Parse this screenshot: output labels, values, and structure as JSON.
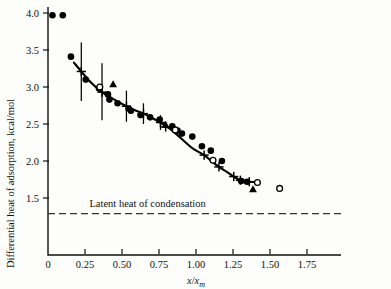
{
  "figure": {
    "caption_absent": true,
    "background_color": "#fdfdfc",
    "ink_color": "#111111"
  },
  "chart_data": {
    "type": "scatter",
    "title": "",
    "xlabel": "x/x_m",
    "xlabel_parts": {
      "numerator": "x",
      "slash": "/",
      "denominator": "x",
      "subscript": "m"
    },
    "ylabel": "Differential heat of adsorption, kcal/mol",
    "xlim": [
      0,
      2.0
    ],
    "ylim": [
      1.2,
      4.1
    ],
    "grid": false,
    "legend": false,
    "xticks": [
      0,
      0.25,
      0.5,
      0.75,
      1.0,
      1.25,
      1.5,
      1.75
    ],
    "xtick_labels": [
      "0",
      "0.25",
      "0.50",
      "0.75",
      "1.00",
      "1.25",
      "1.50",
      "1.75"
    ],
    "yticks": [
      1.5,
      2.0,
      2.5,
      3.0,
      3.5,
      4.0
    ],
    "ytick_labels": [
      "1.5",
      "2.0",
      "2.5",
      "3.0",
      "3.5",
      "4.0"
    ],
    "annotations": [
      {
        "text": "Latent heat of condensation",
        "x": 0.28,
        "y": 1.38,
        "name": "latent-heat-label"
      }
    ],
    "reference_line": {
      "name": "latent-heat-of-condensation",
      "style": "dashed",
      "y": 1.29,
      "x_start": 0.0,
      "x_end": 2.0
    },
    "series": [
      {
        "name": "filled-circles",
        "marker": "filled-circle",
        "points": [
          [
            0.03,
            3.97
          ],
          [
            0.1,
            3.97
          ],
          [
            0.155,
            3.41
          ],
          [
            0.255,
            3.1
          ],
          [
            0.345,
            2.98
          ],
          [
            0.405,
            2.9
          ],
          [
            0.415,
            2.83
          ],
          [
            0.47,
            2.78
          ],
          [
            0.545,
            2.71
          ],
          [
            0.56,
            2.68
          ],
          [
            0.625,
            2.62
          ],
          [
            0.69,
            2.59
          ],
          [
            0.755,
            2.56
          ],
          [
            0.84,
            2.47
          ],
          [
            0.875,
            2.41
          ],
          [
            0.905,
            2.37
          ],
          [
            0.975,
            2.33
          ],
          [
            1.04,
            2.2
          ],
          [
            1.1,
            2.14
          ],
          [
            1.175,
            2.0
          ],
          [
            1.305,
            1.73
          ],
          [
            1.345,
            1.72
          ]
        ]
      },
      {
        "name": "open-circles",
        "marker": "open-circle",
        "points": [
          [
            0.35,
            3.0
          ],
          [
            0.86,
            2.42
          ],
          [
            1.115,
            2.01
          ],
          [
            1.415,
            1.71
          ],
          [
            1.565,
            1.63
          ]
        ]
      },
      {
        "name": "triangles",
        "marker": "filled-triangle",
        "points": [
          [
            0.44,
            3.04
          ],
          [
            0.795,
            2.49
          ],
          [
            1.385,
            1.62
          ]
        ]
      },
      {
        "name": "smoothed-fit-with-plus-markers",
        "marker": "plus",
        "line": "solid",
        "points": [
          [
            0.225,
            3.21
          ],
          [
            0.365,
            2.93
          ],
          [
            0.53,
            2.74
          ],
          [
            0.645,
            2.64
          ],
          [
            0.76,
            2.52
          ],
          [
            0.795,
            2.46
          ],
          [
            1.055,
            2.08
          ],
          [
            1.155,
            1.92
          ],
          [
            1.255,
            1.79
          ],
          [
            1.3,
            1.74
          ],
          [
            1.36,
            1.72
          ]
        ]
      }
    ],
    "error_bars": [
      {
        "x": 0.225,
        "y": 3.21,
        "y_low": 2.81,
        "y_high": 3.6
      },
      {
        "x": 0.365,
        "y": 2.93,
        "y_low": 2.55,
        "y_high": 3.32
      },
      {
        "x": 0.53,
        "y": 2.74,
        "y_low": 2.53,
        "y_high": 2.95
      },
      {
        "x": 0.645,
        "y": 2.64,
        "y_low": 2.5,
        "y_high": 2.78
      },
      {
        "x": 0.76,
        "y": 2.52,
        "y_low": 2.42,
        "y_high": 2.62
      }
    ],
    "fit_curve": [
      [
        0.175,
        3.33
      ],
      [
        0.225,
        3.21
      ],
      [
        0.29,
        3.06
      ],
      [
        0.365,
        2.93
      ],
      [
        0.44,
        2.84
      ],
      [
        0.53,
        2.74
      ],
      [
        0.585,
        2.69
      ],
      [
        0.645,
        2.64
      ],
      [
        0.705,
        2.58
      ],
      [
        0.76,
        2.52
      ],
      [
        0.82,
        2.44
      ],
      [
        0.875,
        2.35
      ],
      [
        0.93,
        2.25
      ],
      [
        0.985,
        2.16
      ],
      [
        1.055,
        2.08
      ],
      [
        1.11,
        1.99
      ],
      [
        1.155,
        1.92
      ],
      [
        1.21,
        1.85
      ],
      [
        1.255,
        1.79
      ],
      [
        1.3,
        1.74
      ],
      [
        1.36,
        1.72
      ],
      [
        1.43,
        1.71
      ]
    ]
  }
}
